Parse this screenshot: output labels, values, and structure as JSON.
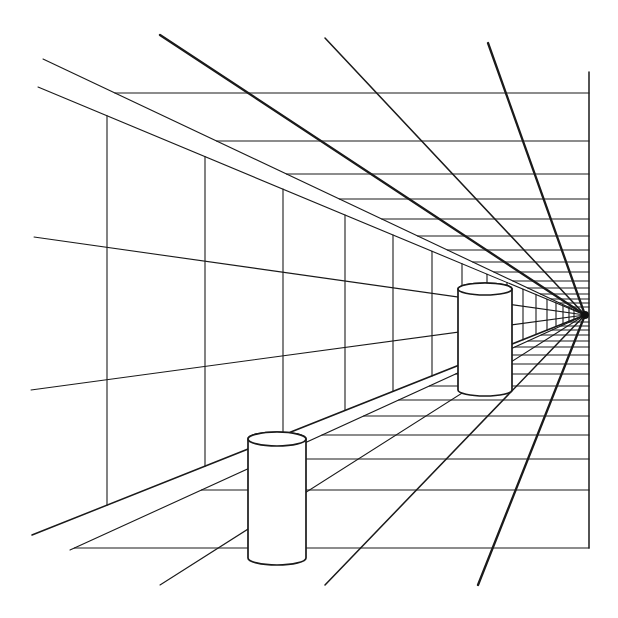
{
  "title": "Perspective corridor illusion with two cylinders",
  "colors": {
    "ink": "#1a1a1a",
    "paper": "#ffffff"
  },
  "vanishing_point": [
    585,
    315
  ],
  "right_edge": {
    "x": 589,
    "y1": 72,
    "y2": 548
  },
  "ceiling_y": [
    93,
    141,
    174,
    199,
    219,
    236,
    250,
    262,
    272,
    281,
    288,
    294,
    299,
    303,
    307
  ],
  "floor_y": [
    548,
    490,
    459,
    435,
    416,
    400,
    386,
    374,
    364,
    355,
    347,
    341,
    335,
    330,
    326,
    322
  ],
  "radial_lines": [
    {
      "from": [
        160,
        35
      ],
      "weight": "thick"
    },
    {
      "from": [
        325,
        38
      ],
      "weight": "med"
    },
    {
      "from": [
        488,
        43
      ],
      "weight": "thick"
    },
    {
      "from": [
        478,
        585
      ],
      "weight": "thick"
    },
    {
      "from": [
        325,
        585
      ],
      "weight": "med"
    },
    {
      "from": [
        160,
        585
      ],
      "weight": "thin"
    }
  ],
  "wall_verticals": [
    107,
    205,
    283,
    345,
    393,
    432,
    462,
    487,
    507,
    523,
    536,
    547,
    556,
    563,
    569,
    574
  ],
  "wall_lines": [
    {
      "from": [
        34,
        237
      ]
    },
    {
      "from": [
        31,
        390
      ]
    }
  ],
  "cylinders": [
    {
      "name": "near",
      "cx": 277,
      "rx": 29,
      "ry": 7,
      "top": 439,
      "bottom": 558
    },
    {
      "name": "far",
      "cx": 485,
      "rx": 27,
      "ry": 6,
      "top": 289,
      "bottom": 390
    }
  ]
}
